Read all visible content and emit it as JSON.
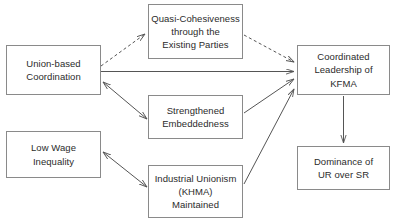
{
  "diagram": {
    "type": "flow-diagram",
    "canvas": {
      "width": 399,
      "height": 221,
      "background": "#ffffff"
    },
    "stroke_color": "#555555",
    "node_border_color": "#8a8a8a",
    "text_color": "#2b2b2b",
    "nodes": [
      {
        "id": "union-based-coordination",
        "label": "Union-based\nCoordination",
        "x": 6,
        "y": 45,
        "w": 95,
        "h": 50
      },
      {
        "id": "quasi-cohesiveness",
        "label": "Quasi-Cohesiveness\nthrough the\nExisting Parties",
        "x": 148,
        "y": 4,
        "w": 95,
        "h": 55
      },
      {
        "id": "coordinated-leadership-kfma",
        "label": "Coordinated\nLeadership of\nKFMA",
        "x": 297,
        "y": 45,
        "w": 93,
        "h": 50
      },
      {
        "id": "strengthened-embeddedness",
        "label": "Strengthened\nEmbeddedness",
        "x": 148,
        "y": 95,
        "w": 95,
        "h": 44
      },
      {
        "id": "low-wage-inequality",
        "label": "Low Wage\nInequality",
        "x": 6,
        "y": 131,
        "w": 95,
        "h": 47
      },
      {
        "id": "industrial-unionism-khma",
        "label": "Industrial Unionism\n(KHMA)\nMaintained",
        "x": 148,
        "y": 165,
        "w": 95,
        "h": 53
      },
      {
        "id": "dominance-ur-over-sr",
        "label": "Dominance of\nUR over SR",
        "x": 297,
        "y": 146,
        "w": 93,
        "h": 44
      }
    ],
    "edges": [
      {
        "id": "union-to-quasi",
        "from": "union-based-coordination",
        "to": "quasi-cohesiveness",
        "style": "dashed",
        "arrows": "end"
      },
      {
        "id": "quasi-to-kfma",
        "from": "quasi-cohesiveness",
        "to": "coordinated-leadership-kfma",
        "style": "dashed",
        "arrows": "end"
      },
      {
        "id": "union-to-kfma",
        "from": "union-based-coordination",
        "to": "coordinated-leadership-kfma",
        "style": "solid",
        "arrows": "end"
      },
      {
        "id": "union-to-embeddedness",
        "from": "union-based-coordination",
        "to": "strengthened-embeddedness",
        "style": "solid",
        "arrows": "both"
      },
      {
        "id": "embeddedness-to-kfma",
        "from": "strengthened-embeddedness",
        "to": "coordinated-leadership-kfma",
        "style": "solid",
        "arrows": "end"
      },
      {
        "id": "lowwage-to-industrial",
        "from": "low-wage-inequality",
        "to": "industrial-unionism-khma",
        "style": "solid",
        "arrows": "both"
      },
      {
        "id": "industrial-to-kfma",
        "from": "industrial-unionism-khma",
        "to": "coordinated-leadership-kfma",
        "style": "solid",
        "arrows": "end"
      },
      {
        "id": "kfma-to-dominance",
        "from": "coordinated-leadership-kfma",
        "to": "dominance-ur-over-sr",
        "style": "solid",
        "arrows": "end"
      }
    ]
  }
}
